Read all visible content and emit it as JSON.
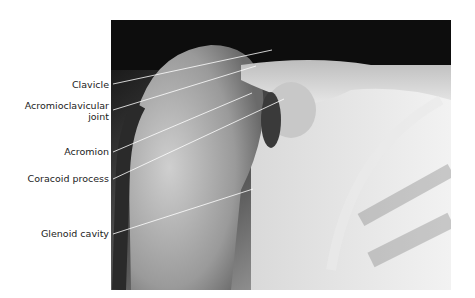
{
  "figure": {
    "labels": [
      {
        "id": "clavicle",
        "text": "Clavicle"
      },
      {
        "id": "acromioclavicular-joint",
        "text_line1": "Acromioclavicular",
        "text_line2": "joint"
      },
      {
        "id": "acromion",
        "text": "Acromion"
      },
      {
        "id": "coracoid-process",
        "text": "Coracoid process"
      },
      {
        "id": "glenoid-cavity",
        "text": "Glenoid cavity"
      }
    ]
  }
}
